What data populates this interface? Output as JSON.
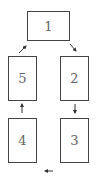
{
  "diagram": {
    "type": "cycle",
    "boxes": [
      {
        "id": "1",
        "label": "1"
      },
      {
        "id": "2",
        "label": "2"
      },
      {
        "id": "3",
        "label": "3"
      },
      {
        "id": "4",
        "label": "4"
      },
      {
        "id": "5",
        "label": "5"
      }
    ],
    "edges": [
      {
        "from": "1",
        "to": "2"
      },
      {
        "from": "2",
        "to": "3"
      },
      {
        "from": "3",
        "to": "4"
      },
      {
        "from": "4",
        "to": "5"
      },
      {
        "from": "5",
        "to": "1"
      }
    ],
    "colors": {
      "border": "#444444",
      "text": "#666666",
      "arrow": "#333333"
    }
  }
}
